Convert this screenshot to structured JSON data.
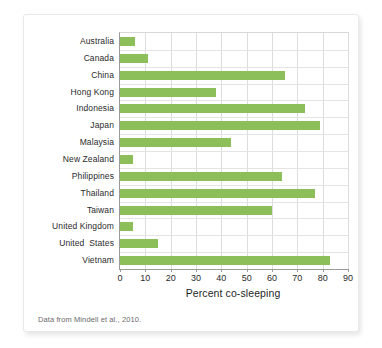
{
  "figure": {
    "source_note": "Data from Mindell et al., 2010.",
    "bar_color": "#8cbf5a",
    "grid_color": "#dcdcdc",
    "axis_color": "#9a9a9a",
    "card_background": "#ffffff",
    "page_background": "#ffffff"
  },
  "chart_data": {
    "type": "bar",
    "orientation": "horizontal",
    "title": "",
    "subtitle": "",
    "xlabel": "Percent co-sleeping",
    "ylabel": "",
    "xlim": [
      0,
      90
    ],
    "xticks": [
      0,
      10,
      20,
      30,
      40,
      50,
      60,
      70,
      80,
      90
    ],
    "xtick_labels": [
      "0",
      "10",
      "20",
      "30",
      "40",
      "50",
      "60",
      "70",
      "80",
      "90"
    ],
    "grid": true,
    "grid_axis": "both",
    "legend": false,
    "legend_position": "none",
    "annotation": "Data from Mindell et al., 2010.",
    "categories": [
      "Australia",
      "Canada",
      "China",
      "Hong Kong",
      "Indonesia",
      "Japan",
      "Malaysia",
      "New Zealand",
      "Philippines",
      "Thailand",
      "Taiwan",
      "United Kingdom",
      "United  States",
      "Vietnam"
    ],
    "values": [
      6,
      11,
      65,
      38,
      73,
      79,
      44,
      5,
      64,
      77,
      60,
      5,
      15,
      83
    ],
    "series": [
      {
        "name": "Percent co-sleeping",
        "values": [
          6,
          11,
          65,
          38,
          73,
          79,
          44,
          5,
          64,
          77,
          60,
          5,
          15,
          83
        ]
      }
    ]
  }
}
